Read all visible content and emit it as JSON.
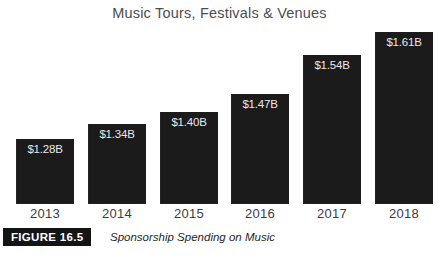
{
  "figure": {
    "badge_label": "FIGURE 16.5",
    "caption": "Sponsorship Spending on Music"
  },
  "colors": {
    "background": "#ffffff",
    "bar": "#1b1b1b",
    "bar_value_text": "#e9e9e9",
    "title_text": "#4d4d4d",
    "tick_text": "#3c3c3c",
    "badge_background": "#141414",
    "badge_text": "#ffffff"
  },
  "chart_data": {
    "type": "bar",
    "title": "Music Tours, Festivals & Venues",
    "xlabel": "",
    "ylabel": "",
    "ylim": [
      0,
      1.75
    ],
    "grid": false,
    "legend": "none",
    "orientation": "vertical",
    "unit": "USD billions",
    "categories": [
      "2013",
      "2014",
      "2015",
      "2016",
      "2017",
      "2018"
    ],
    "values": [
      1.28,
      1.34,
      1.4,
      1.47,
      1.54,
      1.61
    ],
    "data_labels": [
      "$1.28B",
      "$1.34B",
      "$1.40B",
      "$1.47B",
      "$1.54B",
      "$1.61B"
    ],
    "bars": [
      {
        "category": "2013",
        "value": 1.28,
        "label": "$1.28B",
        "left_px": 16,
        "top_px": 139,
        "width_px": 58
      },
      {
        "category": "2014",
        "value": 1.34,
        "label": "$1.34B",
        "left_px": 88,
        "top_px": 124,
        "width_px": 58
      },
      {
        "category": "2015",
        "value": 1.4,
        "label": "$1.40B",
        "left_px": 160,
        "top_px": 112,
        "width_px": 58
      },
      {
        "category": "2016",
        "value": 1.47,
        "label": "$1.47B",
        "left_px": 231,
        "top_px": 94,
        "width_px": 58
      },
      {
        "category": "2017",
        "value": 1.54,
        "label": "$1.54B",
        "left_px": 303,
        "top_px": 55,
        "width_px": 58
      },
      {
        "category": "2018",
        "value": 1.61,
        "label": "$1.61B",
        "left_px": 375,
        "top_px": 32,
        "width_px": 58
      }
    ]
  }
}
